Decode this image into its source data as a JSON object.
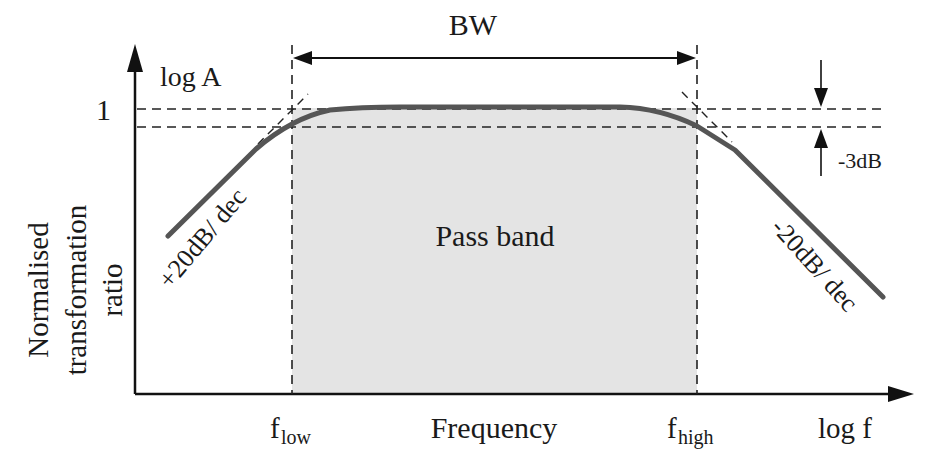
{
  "diagram": {
    "type": "bandpass-frequency-response",
    "colors": {
      "axis": "#111111",
      "curve": "#555555",
      "passband_fill": "#e4e4e4",
      "dashed": "#222222",
      "text": "#1a1a1a"
    },
    "labels": {
      "bandwidth": "BW",
      "y_axis_top": "log A",
      "y_unity": "1",
      "y_axis_title_line1": "Normalised",
      "y_axis_title_line2": "transformation",
      "y_axis_title_line3": "ratio",
      "rising_slope": "+20dB/ dec",
      "falling_slope": "-20dB/ dec",
      "pass_band": "Pass band",
      "cutoff_drop": "-3dB",
      "f_low_base": "f",
      "f_low_sub": "low",
      "f_high_base": "f",
      "f_high_sub": "high",
      "x_axis_title": "Frequency",
      "x_axis_end": "log f"
    }
  }
}
